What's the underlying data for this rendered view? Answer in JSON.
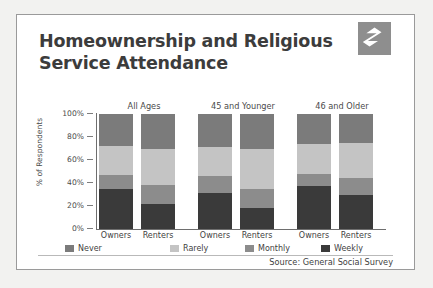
{
  "poster": {
    "title_line1": "Homeownership and Religious",
    "title_line2": "Service Attendance",
    "logo_name": "zillow-z-logo",
    "source": "Source: General Social Survey"
  },
  "chart_data": {
    "type": "bar",
    "subtype": "stacked-column-100",
    "title": "Homeownership and Religious Service Attendance",
    "xlabel": "",
    "ylabel": "% of Respondents",
    "ylim": [
      0,
      100
    ],
    "yticks": [
      "0%",
      "20%",
      "40%",
      "60%",
      "80%",
      "100%"
    ],
    "ytick_values": [
      0,
      20,
      40,
      60,
      80,
      100
    ],
    "grid": false,
    "legend_position": "bottom",
    "groups": [
      "All Ages",
      "45 and Younger",
      "46 and Older"
    ],
    "categories": [
      "Owners",
      "Renters",
      "Owners",
      "Renters",
      "Owners",
      "Renters"
    ],
    "series": [
      {
        "name": "Weekly",
        "color": "#3a3a3a",
        "values": [
          35,
          22,
          31,
          18,
          37,
          30
        ]
      },
      {
        "name": "Monthly",
        "color": "#8c8c8c",
        "values": [
          12,
          16,
          15,
          17,
          11,
          14
        ]
      },
      {
        "name": "Rarely",
        "color": "#c4c4c4",
        "values": [
          25,
          32,
          25,
          35,
          26,
          31
        ]
      },
      {
        "name": "Never",
        "color": "#7b7b7b",
        "values": [
          28,
          30,
          29,
          30,
          26,
          25
        ]
      }
    ],
    "legend": [
      {
        "label": "Never",
        "color": "#7b7b7b"
      },
      {
        "label": "Rarely",
        "color": "#c4c4c4"
      },
      {
        "label": "Monthly",
        "color": "#8c8c8c"
      },
      {
        "label": "Weekly",
        "color": "#3a3a3a"
      }
    ],
    "colors": {
      "never": "#7b7b7b",
      "rarely": "#c4c4c4",
      "monthly": "#8c8c8c",
      "weekly": "#3a3a3a",
      "axis": "#6e6e6e",
      "text": "#3f3f3f",
      "title": "#3c3c3c",
      "logo_bg": "#8e8e8e",
      "card_bg": "#ffffff",
      "page_bg": "#f2f2f0"
    }
  },
  "yticks": [
    {
      "label": "100%",
      "value": 100
    },
    {
      "label": "80%",
      "value": 80
    },
    {
      "label": "60%",
      "value": 60
    },
    {
      "label": "40%",
      "value": 40
    },
    {
      "label": "20%",
      "value": 20
    },
    {
      "label": "0%",
      "value": 0
    }
  ]
}
